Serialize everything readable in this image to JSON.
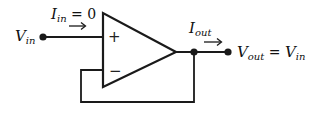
{
  "diagram": {
    "type": "voltage-follower",
    "components": {
      "opamp": {
        "plus_sign": "+",
        "minus_sign": "−"
      }
    },
    "labels": {
      "vin": {
        "base": "V",
        "sub": "in"
      },
      "iin": {
        "base": "I",
        "sub": "in",
        "rhs": " = 0"
      },
      "iout": {
        "base": "I",
        "sub": "out"
      },
      "vout": {
        "base": "V",
        "sub": "out",
        "eq": " = ",
        "rhs_base": "V",
        "rhs_sub": "in"
      }
    },
    "arrows": {
      "iin_arrow": "→",
      "iout_arrow": "→"
    },
    "colors": {
      "line": "#1a1a1a",
      "background": "#ffffff"
    }
  }
}
